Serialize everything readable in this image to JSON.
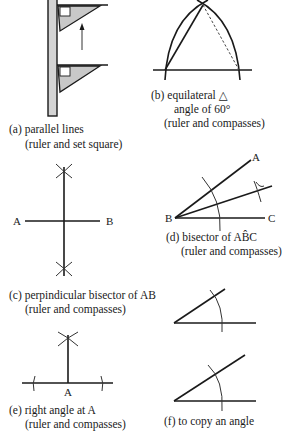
{
  "figure": {
    "panels": [
      {
        "id": "a",
        "caption_line1": "(a) parallel lines",
        "caption_line2": "(ruler and set square)",
        "elements": [
          "ruler",
          "set-square-top",
          "set-square-bottom",
          "up-arrow"
        ]
      },
      {
        "id": "b",
        "caption_line1": "(b) equilateral △",
        "caption_line2": "angle of 60°",
        "caption_line3": "(ruler and compasses)",
        "elements": [
          "baseline",
          "arc-left",
          "arc-right",
          "side-solid",
          "side-dashed"
        ]
      },
      {
        "id": "c",
        "caption_line1": "(c) perpindicular bisector of AB",
        "caption_line2": "(ruler and compasses)",
        "points": {
          "left": "A",
          "right": "B"
        }
      },
      {
        "id": "d",
        "caption_line1": "(d) bisector of AB̂C",
        "caption_line2": "(ruler and compasses)",
        "points": {
          "upper": "A",
          "vertex": "B",
          "lower": "C"
        }
      },
      {
        "id": "e",
        "caption_line1": "(e) right angle at A",
        "caption_line2": "(ruler and compasses)",
        "points": {
          "base": "A"
        }
      },
      {
        "id": "f",
        "caption_line1": "(f) to copy an angle"
      }
    ],
    "colors": {
      "ink": "#1a1a1a",
      "ruler_fill": "#d4d4d4",
      "set_square_fill": "#c8c8c8",
      "background": "#ffffff"
    }
  }
}
